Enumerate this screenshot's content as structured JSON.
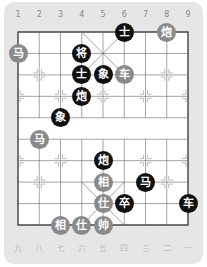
{
  "top_labels": [
    "1",
    "2",
    "3",
    "4",
    "5",
    "6",
    "7",
    "8",
    "9"
  ],
  "bottom_labels": [
    "九",
    "八",
    "七",
    "六",
    "五",
    "四",
    "三",
    "二",
    "一"
  ],
  "colors": {
    "black_piece": "#111111",
    "red_piece": "#8a8a8a",
    "card": "#e6e6e6",
    "board": "#ffffff",
    "line": "#555555"
  },
  "pieces": [
    {
      "side": "black",
      "char": "士",
      "col": 6,
      "row": 1
    },
    {
      "side": "red",
      "char": "炮",
      "col": 8,
      "row": 1
    },
    {
      "side": "black",
      "char": "将",
      "col": 4,
      "row": 2
    },
    {
      "side": "red",
      "char": "马",
      "col": 1,
      "row": 2
    },
    {
      "side": "black",
      "char": "士",
      "col": 4,
      "row": 3
    },
    {
      "side": "black",
      "char": "象",
      "col": 5,
      "row": 3
    },
    {
      "side": "red",
      "char": "车",
      "col": 6,
      "row": 3
    },
    {
      "side": "black",
      "char": "炮",
      "col": 4,
      "row": 4
    },
    {
      "side": "black",
      "char": "象",
      "col": 3,
      "row": 5
    },
    {
      "side": "red",
      "char": "马",
      "col": 2,
      "row": 6
    },
    {
      "side": "black",
      "char": "炮",
      "col": 5,
      "row": 7
    },
    {
      "side": "red",
      "char": "相",
      "col": 5,
      "row": 8
    },
    {
      "side": "black",
      "char": "马",
      "col": 7,
      "row": 8
    },
    {
      "side": "red",
      "char": "仕",
      "col": 5,
      "row": 9
    },
    {
      "side": "black",
      "char": "卒",
      "col": 6,
      "row": 9
    },
    {
      "side": "black",
      "char": "车",
      "col": 9,
      "row": 9
    },
    {
      "side": "red",
      "char": "相",
      "col": 3,
      "row": 10
    },
    {
      "side": "red",
      "char": "仕",
      "col": 4,
      "row": 10
    },
    {
      "side": "red",
      "char": "帅",
      "col": 5,
      "row": 10
    }
  ]
}
